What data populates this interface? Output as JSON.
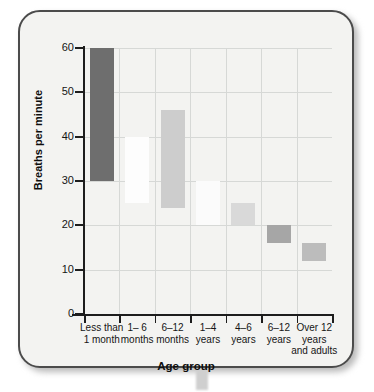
{
  "chart_data": {
    "type": "bar",
    "title": "",
    "subtitle": "",
    "xlabel": "Age group",
    "ylabel": "Breaths per minute",
    "ylim": [
      0,
      60
    ],
    "yticks": [
      0,
      10,
      20,
      30,
      40,
      50,
      60
    ],
    "grid": true,
    "legend": null,
    "note": "Floating range bars: each bar spans the normal respiratory-rate range (low to high) for the age group.",
    "categories": [
      "Less than 1 month",
      "1– 6 months",
      "6–12 months",
      "1–4 years",
      "4–6 years",
      "6–12 years",
      "Over 12 years and adults"
    ],
    "category_lines": [
      [
        "Less than",
        "1 month"
      ],
      [
        "1– 6",
        "months"
      ],
      [
        "6–12",
        "months"
      ],
      [
        "1–4",
        "years"
      ],
      [
        "4–6",
        "years"
      ],
      [
        "6–12",
        "years"
      ],
      [
        "Over 12",
        "years",
        "and adults"
      ]
    ],
    "series": [
      {
        "name": "Respiratory rate range",
        "low": [
          30,
          25,
          24,
          20,
          20,
          16,
          12
        ],
        "high": [
          60,
          40,
          46,
          30,
          25,
          20,
          16
        ],
        "colors": [
          "#6e6e6e",
          "#fdfdfd",
          "#cdcdcd",
          "#fbfbfb",
          "#d9d9d9",
          "#a6a6a6",
          "#bcbcbc"
        ]
      }
    ],
    "values_low": [
      30,
      25,
      24,
      20,
      20,
      16,
      12
    ],
    "values_high": [
      60,
      40,
      46,
      30,
      25,
      20,
      16
    ]
  },
  "figure": {
    "background_color": "#f3f3f1",
    "border_color": "#4b4b4b",
    "grid_color": "#d6d8d6",
    "axis_color": "#1d1d1d"
  }
}
